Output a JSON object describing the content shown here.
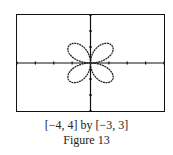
{
  "chart_data": {
    "type": "line",
    "title": "",
    "equation_hint": "four-petal rose curve, petals in diagonal quadrants",
    "xlim": [
      -4,
      4
    ],
    "ylim": [
      -3,
      3
    ],
    "xscale": 1,
    "yscale": 1,
    "grid": false,
    "series": [
      {
        "name": "rose",
        "petal_extent": 1.6,
        "petals": 4,
        "orientation": "diagonal"
      }
    ],
    "xlabel": "",
    "ylabel": ""
  },
  "caption": {
    "window": "[−4, 4] by [−3, 3]",
    "figure": "Figure 13"
  }
}
